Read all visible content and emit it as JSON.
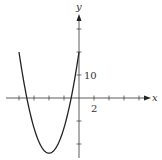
{
  "chart_data": {
    "type": "line",
    "title": "",
    "xlabel": "x",
    "ylabel": "y",
    "xlim": [
      -10,
      13
    ],
    "ylim": [
      -28,
      36
    ],
    "x_tick_step": 2,
    "y_tick_step": 10,
    "x_tick_labels": [
      {
        "value": 2,
        "label": "2"
      }
    ],
    "y_tick_labels": [
      {
        "value": 10,
        "label": "10"
      }
    ],
    "grid": false,
    "legend": null,
    "series": [
      {
        "name": "parabola",
        "x": [
          -8,
          -7,
          -6,
          -5,
          -4,
          -3,
          -2,
          -1,
          0
        ],
        "y": [
          20,
          6.5,
          -14,
          -21.5,
          -24,
          -21.5,
          -14,
          -1.5,
          33
        ]
      }
    ],
    "curve_model": {
      "a": 2.75,
      "h": -4,
      "k": -24,
      "x_from": -8,
      "x_to": 0
    }
  },
  "axes": {
    "x_label": "x",
    "y_label": "y",
    "x_tick_label": "2",
    "y_tick_label": "10"
  }
}
